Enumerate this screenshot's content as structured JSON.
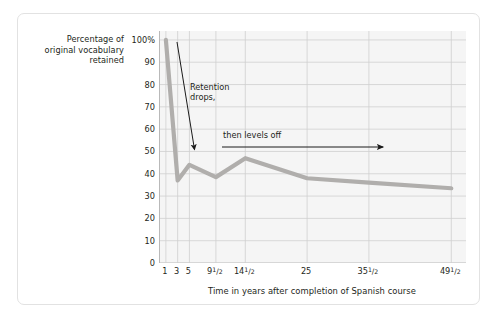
{
  "chart_data": {
    "type": "line",
    "title": "",
    "xlabel": "Time in years after completion of Spanish course",
    "ylabel": "Percentage of original vocabulary retained",
    "ylabel_lines": [
      "Percentage of",
      "original vocabulary",
      "retained"
    ],
    "categories": [
      "1",
      "3",
      "5",
      "9½",
      "14½",
      "25",
      "35½",
      "49½"
    ],
    "x_tick_labels": [
      {
        "whole": "1",
        "num": "",
        "den": ""
      },
      {
        "whole": "3",
        "num": "",
        "den": ""
      },
      {
        "whole": "5",
        "num": "",
        "den": ""
      },
      {
        "whole": "9",
        "num": "1",
        "den": "2"
      },
      {
        "whole": "14",
        "num": "1",
        "den": "2"
      },
      {
        "whole": "25",
        "num": "",
        "den": ""
      },
      {
        "whole": "35",
        "num": "1",
        "den": "2"
      },
      {
        "whole": "49",
        "num": "1",
        "den": "2"
      }
    ],
    "x_positions": [
      1,
      3,
      5,
      9.5,
      14.5,
      25,
      35.5,
      49.5
    ],
    "values": [
      100,
      37,
      44,
      38.5,
      47,
      38,
      36,
      33.5
    ],
    "y_tick_labels": [
      "100%",
      "90",
      "80",
      "70",
      "60",
      "50",
      "40",
      "30",
      "20",
      "10",
      "0"
    ],
    "y_ticks": [
      100,
      90,
      80,
      70,
      60,
      50,
      40,
      30,
      20,
      10,
      0
    ],
    "ylim": [
      0,
      104
    ],
    "xlim": [
      0,
      52
    ],
    "grid": true,
    "legend": "none",
    "line_color": "#b0aeac",
    "grid_color": "#cfcfcf",
    "plot_background": "#f5f5f5",
    "annotations": [
      {
        "text": "Retention\ndrops,",
        "arrow": "diagonal-down"
      },
      {
        "text": "then levels off",
        "arrow": "horizontal-right"
      }
    ]
  },
  "annotations": {
    "retention_drops": "Retention\ndrops,",
    "then_levels_off": "then levels off"
  },
  "axis": {
    "y_caption_line1": "Percentage of",
    "y_caption_line2": "original vocabulary",
    "y_caption_line3": "retained",
    "x_title": "Time in years after completion of Spanish course"
  }
}
